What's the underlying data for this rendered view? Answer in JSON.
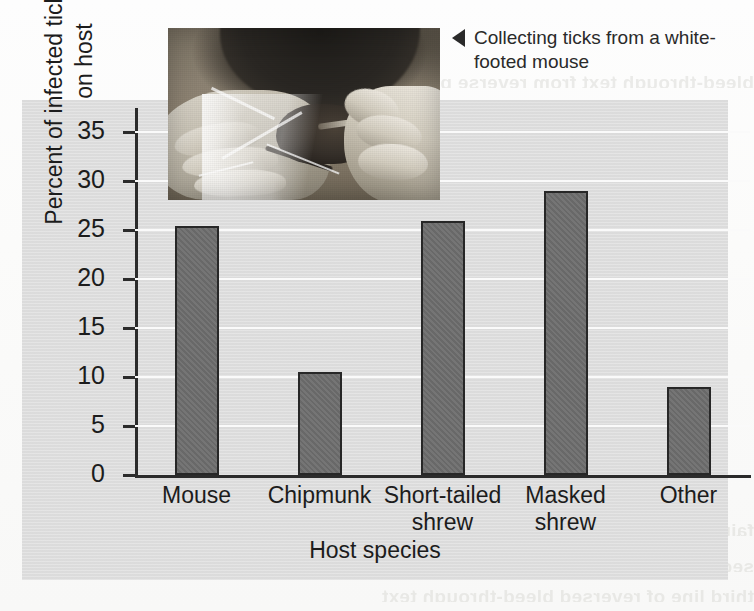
{
  "caption": {
    "arrow": "left-triangle-marker",
    "text": "Collecting ticks from a white-footed mouse"
  },
  "photo": {
    "alt_name": "photo-collecting-ticks-white-footed-mouse"
  },
  "colors": {
    "panel_background": "#dedede",
    "bar_fill": "#6e6e6e",
    "bar_stroke": "#272727",
    "gridline": "#fafafa",
    "axis": "#2b2b2b",
    "text": "#1c1c1c"
  },
  "chart_data": {
    "type": "bar",
    "title": "",
    "categories": [
      "Mouse",
      "Chipmunk",
      "Short-tailed shrew",
      "Masked shrew",
      "Other"
    ],
    "values": [
      25.4,
      10.5,
      26.0,
      29.0,
      9.0
    ],
    "xlabel": "Host species",
    "ylabel": "Percent of infected ticks that fed on host",
    "ylim": [
      0,
      37.5
    ],
    "yticks": [
      0,
      5,
      10,
      15,
      20,
      25,
      30,
      35
    ],
    "ytick_labels": [
      "0",
      "5",
      "10",
      "15",
      "20",
      "25",
      "30",
      "35"
    ],
    "grid": true,
    "legend": "none"
  },
  "bleed_text": {
    "line1": "bleed-through text from reverse page",
    "line2": "faint reversed text showing through paper",
    "line3": "second line of reversed bleed-through text",
    "line4": "third line of reversed bleed-through text"
  }
}
